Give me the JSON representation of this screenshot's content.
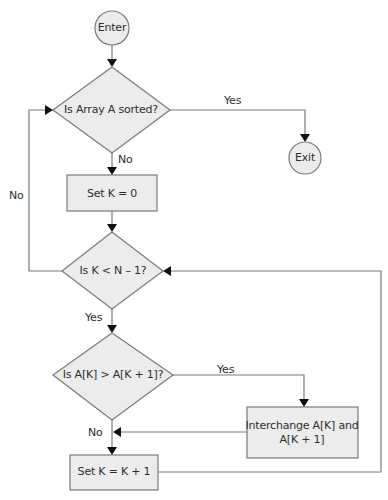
{
  "diagram": {
    "colors": {
      "shape_fill": "#ececec",
      "stroke": "#7a7a7a",
      "arrowhead": "#111111",
      "text": "#2e2e2e"
    },
    "nodes": {
      "enter": {
        "type": "terminal",
        "label": "Enter"
      },
      "exit": {
        "type": "terminal",
        "label": "Exit"
      },
      "is_sorted": {
        "type": "decision",
        "label": "Is Array A sorted?"
      },
      "set_k_zero": {
        "type": "process",
        "label": "Set K = 0"
      },
      "k_less": {
        "type": "decision",
        "label": "Is K < N – 1?"
      },
      "compare": {
        "type": "decision",
        "label": "Is A[K] > A[K + 1]?"
      },
      "interchange": {
        "type": "process",
        "label_line1": "Interchange A[K] and",
        "label_line2": "A[K + 1]"
      },
      "increment": {
        "type": "process",
        "label": "Set K = K + 1"
      }
    },
    "edges": {
      "sorted_yes": "Yes",
      "sorted_no": "No",
      "k_less_no": "No",
      "k_less_yes": "Yes",
      "compare_yes": "Yes",
      "compare_no": "No"
    }
  }
}
